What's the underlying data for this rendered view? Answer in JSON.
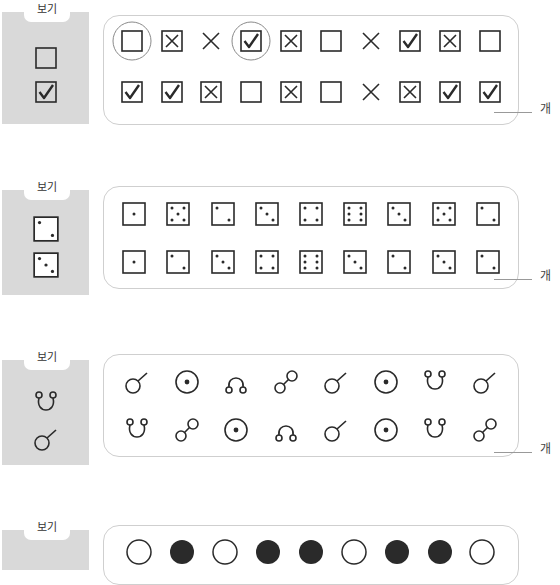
{
  "legend_label": "보기",
  "answer_unit": "개",
  "sections": [
    {
      "type": "checkbox",
      "legend": [
        "empty",
        "check"
      ],
      "rows": [
        [
          "empty",
          "xbox",
          "x",
          "check",
          "xbox",
          "empty",
          "x",
          "check",
          "xbox",
          "empty"
        ],
        [
          "check",
          "check",
          "xbox",
          "empty",
          "xbox",
          "empty",
          "x",
          "xbox",
          "check",
          "check"
        ]
      ],
      "circled": [
        [
          0,
          0
        ],
        [
          0,
          3
        ]
      ]
    },
    {
      "type": "dice",
      "legend": [
        2,
        3
      ],
      "rows": [
        [
          1,
          5,
          2,
          3,
          4,
          6,
          3,
          5,
          2
        ],
        [
          1,
          2,
          3,
          4,
          6,
          3,
          2,
          3,
          2
        ]
      ]
    },
    {
      "type": "ring",
      "legend": [
        "u",
        "stick"
      ],
      "rows": [
        [
          "stick",
          "dot",
          "arch",
          "dumbbell",
          "stick",
          "dot",
          "u",
          "stick"
        ],
        [
          "u",
          "dumbbell",
          "dot",
          "arch",
          "stick",
          "dot",
          "u",
          "dumbbell"
        ]
      ]
    },
    {
      "type": "circle",
      "legend": [],
      "rows": [
        [
          "open",
          "filled",
          "open",
          "filled",
          "filled",
          "open",
          "filled",
          "filled",
          "open"
        ]
      ]
    }
  ],
  "colors": {
    "legend_bg": "#d9d9d9",
    "frame_border": "#cfcfcf",
    "ink": "#2a2a2a",
    "circle_mark": "#8a8a8a"
  }
}
